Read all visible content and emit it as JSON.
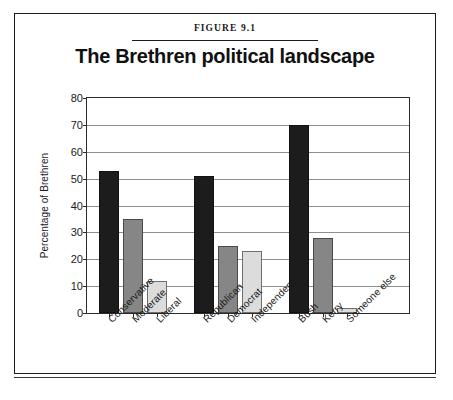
{
  "figure": {
    "number": "FIGURE 9.1",
    "title": "The Brethren political landscape"
  },
  "chart_data": {
    "type": "bar",
    "title": "The Brethren political landscape",
    "xlabel": "",
    "ylabel": "Percentage of Brethren",
    "ylim": [
      0,
      80
    ],
    "ytick_step": 10,
    "yticks": [
      "0",
      "10",
      "20",
      "30",
      "40",
      "50",
      "60",
      "70",
      "80"
    ],
    "grid": true,
    "legend": "none",
    "categories": [
      "Conservative",
      "Moderate",
      "Liberal",
      "Republican",
      "Democrat",
      "Independent",
      "Bush",
      "Kerry",
      "Someone else"
    ],
    "values": [
      53,
      35,
      12,
      51,
      25,
      23,
      70,
      28,
      2
    ],
    "bar_styles": [
      "dark",
      "mid",
      "light",
      "dark",
      "mid",
      "light",
      "dark",
      "mid",
      "light"
    ],
    "groups": [
      {
        "name": "Ideology",
        "categories": [
          "Conservative",
          "Moderate",
          "Liberal"
        ]
      },
      {
        "name": "Party",
        "categories": [
          "Republican",
          "Democrat",
          "Independent"
        ]
      },
      {
        "name": "2004 vote",
        "categories": [
          "Bush",
          "Kerry",
          "Someone else"
        ]
      }
    ]
  },
  "colors": {
    "bar_dark": "#1c1c1c",
    "bar_mid": "#868686",
    "bar_light": "#dcdcdc",
    "axis": "#2b2b2b",
    "grid": "#8e8e8e",
    "text": "#1a1a1a",
    "background": "#ffffff"
  }
}
